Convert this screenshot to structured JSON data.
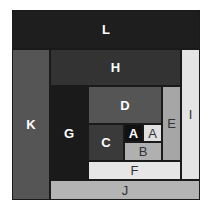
{
  "diagram": {
    "type": "nested-rectangles",
    "blocks": [
      {
        "id": "L",
        "label": "L",
        "x": 12,
        "y": 10,
        "w": 188,
        "h": 39,
        "fill": "#1e1e1e",
        "text": "dark"
      },
      {
        "id": "K",
        "label": "K",
        "x": 12,
        "y": 49,
        "w": 38,
        "h": 151,
        "fill": "#555555",
        "text": "dark"
      },
      {
        "id": "H",
        "label": "H",
        "x": 50,
        "y": 49,
        "w": 131,
        "h": 37,
        "fill": "#333333",
        "text": "dark"
      },
      {
        "id": "I",
        "label": "I",
        "x": 181,
        "y": 49,
        "w": 19,
        "h": 131,
        "fill": "#e4e4e4",
        "text": "light"
      },
      {
        "id": "G",
        "label": "G",
        "x": 50,
        "y": 86,
        "w": 38,
        "h": 94,
        "fill": "#1a1a1a",
        "text": "dark"
      },
      {
        "id": "D",
        "label": "D",
        "x": 88,
        "y": 86,
        "w": 74,
        "h": 38,
        "fill": "#555555",
        "text": "dark"
      },
      {
        "id": "E",
        "label": "E",
        "x": 162,
        "y": 86,
        "w": 19,
        "h": 75,
        "fill": "#a6a6a6",
        "text": "light"
      },
      {
        "id": "C",
        "label": "C",
        "x": 88,
        "y": 124,
        "w": 36,
        "h": 37,
        "fill": "#3a3a3a",
        "text": "dark"
      },
      {
        "id": "A1",
        "label": "A",
        "x": 124,
        "y": 124,
        "w": 19,
        "h": 18,
        "fill": "#111111",
        "text": "dark"
      },
      {
        "id": "A2",
        "label": "A",
        "x": 143,
        "y": 124,
        "w": 19,
        "h": 18,
        "fill": "#e0e0e0",
        "text": "light"
      },
      {
        "id": "B",
        "label": "B",
        "x": 124,
        "y": 142,
        "w": 38,
        "h": 19,
        "fill": "#b0b0b0",
        "text": "light"
      },
      {
        "id": "F",
        "label": "F",
        "x": 88,
        "y": 161,
        "w": 93,
        "h": 19,
        "fill": "#e6e6e6",
        "text": "light"
      },
      {
        "id": "J",
        "label": "J",
        "x": 50,
        "y": 180,
        "w": 150,
        "h": 20,
        "fill": "#b4b4b4",
        "text": "light"
      }
    ]
  }
}
